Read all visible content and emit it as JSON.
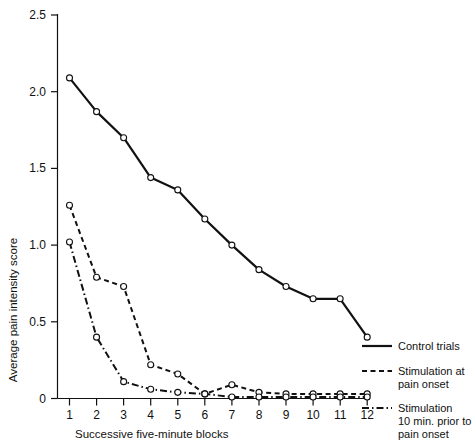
{
  "chart_data": {
    "type": "line",
    "title": "",
    "xlabel": "Successive five-minute blocks",
    "ylabel": "Average pain intensity score",
    "x": [
      1,
      2,
      3,
      4,
      5,
      6,
      7,
      8,
      9,
      10,
      11,
      12
    ],
    "xtick_labels": [
      "1",
      "2",
      "3",
      "4",
      "5",
      "6",
      "7",
      "8",
      "9",
      "10",
      "11",
      "12"
    ],
    "ytick_labels": [
      "0",
      "0.5",
      "1.0",
      "1.5",
      "2.0",
      "2.5"
    ],
    "yticks": [
      0,
      0.5,
      1.0,
      1.5,
      2.0,
      2.5
    ],
    "xlim": [
      0.45,
      12.55
    ],
    "ylim": [
      0,
      2.5
    ],
    "grid": false,
    "legend_position": "right",
    "series": [
      {
        "name": "Control trials",
        "style": "solid",
        "marker": "open-circle",
        "values": [
          2.09,
          1.87,
          1.7,
          1.44,
          1.36,
          1.17,
          1.0,
          0.84,
          0.73,
          0.65,
          0.65,
          0.4
        ]
      },
      {
        "name": "Stimulation at pain onset",
        "style": "dashed",
        "marker": "open-circle",
        "values": [
          1.26,
          0.79,
          0.73,
          0.22,
          0.16,
          0.03,
          0.09,
          0.04,
          0.03,
          0.03,
          0.03,
          0.03
        ]
      },
      {
        "name": "Stimulation 10 min. prior to pain onset",
        "style": "dashdot",
        "marker": "open-circle",
        "values": [
          1.02,
          0.4,
          0.11,
          0.06,
          0.04,
          0.03,
          0.01,
          0.01,
          0.01,
          0.01,
          0.01,
          0.01
        ]
      }
    ]
  },
  "axes": {
    "y_title": "Average pain intensity score",
    "x_title": "Successive five-minute blocks",
    "y_labels": {
      "t0": "0",
      "t1": "0.5",
      "t2": "1.0",
      "t3": "1.5",
      "t4": "2.0",
      "t5": "2.5"
    },
    "x_labels": {
      "x1": "1",
      "x2": "2",
      "x3": "3",
      "x4": "4",
      "x5": "5",
      "x6": "6",
      "x7": "7",
      "x8": "8",
      "x9": "9",
      "x10": "10",
      "x11": "11",
      "x12": "12"
    }
  },
  "legend": {
    "entries": [
      {
        "label_line1": "Control trials",
        "label_line2": "",
        "label_line3": "",
        "style": "solid"
      },
      {
        "label_line1": "Stimulation at",
        "label_line2": "pain onset",
        "label_line3": "",
        "style": "dashed"
      },
      {
        "label_line1": "Stimulation",
        "label_line2": "10 min. prior to",
        "label_line3": "pain onset",
        "style": "dashdot"
      }
    ]
  },
  "colors": {
    "ink": "#111111",
    "background": "#ffffff",
    "marker_fill": "#ffffff"
  }
}
